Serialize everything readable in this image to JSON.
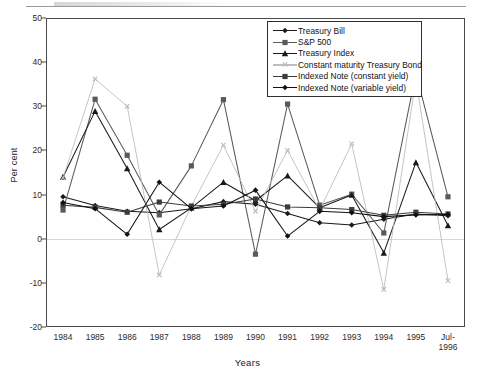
{
  "page": {
    "header_note": ""
  },
  "chart_data": {
    "type": "line",
    "title": "",
    "xlabel": "Years",
    "ylabel": "Per cent",
    "ylim": [
      -20,
      50
    ],
    "yticks": [
      50,
      40,
      30,
      20,
      10,
      0,
      -10,
      -20
    ],
    "grid": false,
    "legend_position": "top-right",
    "categories": [
      "1984",
      "1985",
      "1986",
      "1987",
      "1988",
      "1989",
      "1990",
      "1991",
      "1992",
      "1993",
      "1994",
      "1995",
      "Jul-1996"
    ],
    "category_lines": [
      [
        "1984"
      ],
      [
        "1985"
      ],
      [
        "1986"
      ],
      [
        "1987"
      ],
      [
        "1988"
      ],
      [
        "1989"
      ],
      [
        "1990"
      ],
      [
        "1991"
      ],
      [
        "1992"
      ],
      [
        "1993"
      ],
      [
        "1994"
      ],
      [
        "1995"
      ],
      [
        "Jul-",
        "1996"
      ]
    ],
    "series": [
      {
        "name": "Treasury Bill",
        "marker": "diamond",
        "color": "#1a1a1a",
        "values": [
          9.5,
          7.5,
          6.2,
          5.9,
          6.8,
          8.4,
          7.8,
          5.7,
          3.6,
          3.1,
          4.4,
          5.6,
          5.2
        ]
      },
      {
        "name": "S&P 500",
        "marker": "square",
        "color": "#5a5a5a",
        "values": [
          6.5,
          31.6,
          18.9,
          5.4,
          16.5,
          31.5,
          -3.5,
          30.5,
          7.6,
          10.1,
          1.3,
          37.5,
          9.5
        ]
      },
      {
        "name": "Treasury Index",
        "marker": "triangle",
        "color": "#1a1a1a",
        "values": [
          14.0,
          28.9,
          15.9,
          2.1,
          7.0,
          12.8,
          8.6,
          14.3,
          7.0,
          9.9,
          -3.2,
          17.3,
          3.0
        ]
      },
      {
        "name": "Constant maturity Treasury Bond",
        "marker": "cross",
        "color": "#bdbdbd",
        "values": [
          13.8,
          36.2,
          30.0,
          -8.2,
          7.4,
          21.2,
          6.2,
          20.0,
          6.5,
          21.5,
          -11.5,
          36.0,
          -9.5
        ]
      },
      {
        "name": "Indexed Note (constant yield)",
        "marker": "square",
        "color": "#3c3c3c",
        "values": [
          7.6,
          7.1,
          6.0,
          8.3,
          7.4,
          7.8,
          9.0,
          7.2,
          7.0,
          6.6,
          5.3,
          6.0,
          5.6
        ]
      },
      {
        "name": "Indexed Note (variable yield)",
        "marker": "diamond",
        "color": "#111111",
        "values": [
          8.2,
          6.8,
          1.0,
          12.8,
          6.8,
          7.4,
          11.0,
          0.6,
          6.2,
          5.9,
          5.0,
          5.4,
          5.5
        ]
      }
    ]
  }
}
